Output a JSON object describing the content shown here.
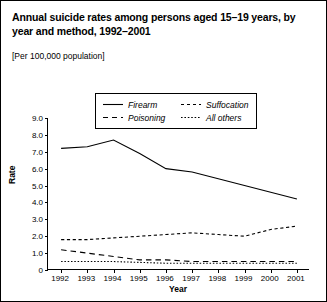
{
  "title": "Annual suicide rates among persons aged 15–19 years, by year and method, 1992–2001",
  "subtitle": "[Per 100,000 population]",
  "legend": {
    "items": [
      {
        "label": "Firearm",
        "style": "solid"
      },
      {
        "label": "Suffocation",
        "style": "dashed"
      },
      {
        "label": "Poisoning",
        "style": "longdash"
      },
      {
        "label": "All others",
        "style": "dotted"
      }
    ]
  },
  "chart_data": {
    "type": "line",
    "title": "Annual suicide rates among persons aged 15–19 years, by year and method, 1992–2001",
    "subtitle": "[Per 100,000 population]",
    "xlabel": "Year",
    "ylabel": "Rate",
    "categories": [
      "1992",
      "1993",
      "1994",
      "1995",
      "1996",
      "1997",
      "1998",
      "1999",
      "2000",
      "2001"
    ],
    "x": [
      1992,
      1993,
      1994,
      1995,
      1996,
      1997,
      1998,
      1999,
      2000,
      2001
    ],
    "ylim": [
      0,
      9
    ],
    "yticks": [
      "0",
      "1.0",
      "2.0",
      "3.0",
      "4.0",
      "5.0",
      "6.0",
      "7.0",
      "8.0",
      "9.0"
    ],
    "ytick_values": [
      0,
      1,
      2,
      3,
      4,
      5,
      6,
      7,
      8,
      9
    ],
    "grid": false,
    "legend_position": "top-center",
    "series": [
      {
        "name": "Firearm",
        "style": "solid",
        "values": [
          7.2,
          7.3,
          7.7,
          6.9,
          6.0,
          5.8,
          5.4,
          5.0,
          4.6,
          4.2
        ]
      },
      {
        "name": "Suffocation",
        "style": "dashed",
        "values": [
          1.8,
          1.8,
          1.9,
          2.0,
          2.1,
          2.2,
          2.1,
          2.0,
          2.4,
          2.6
        ]
      },
      {
        "name": "Poisoning",
        "style": "longdash",
        "values": [
          1.2,
          1.0,
          0.8,
          0.6,
          0.6,
          0.5,
          0.5,
          0.5,
          0.5,
          0.5
        ]
      },
      {
        "name": "All others",
        "style": "dotted",
        "values": [
          0.5,
          0.5,
          0.5,
          0.45,
          0.4,
          0.4,
          0.4,
          0.4,
          0.4,
          0.4
        ]
      }
    ]
  }
}
